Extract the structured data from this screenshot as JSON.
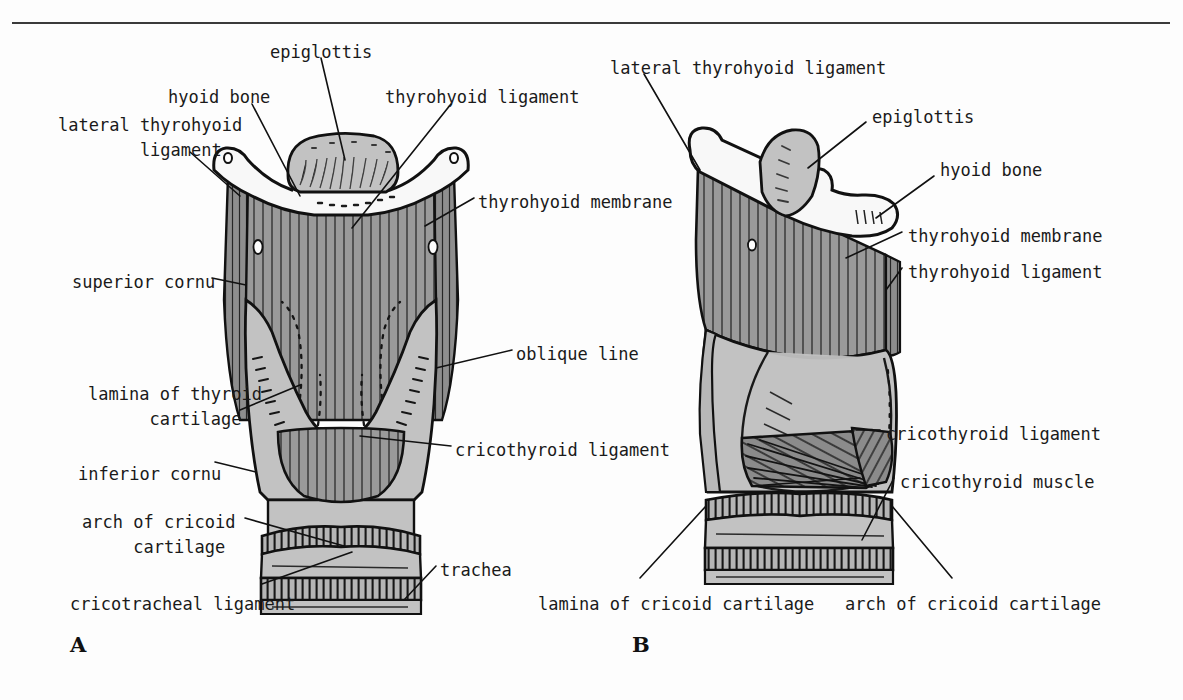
{
  "figure": {
    "panels": [
      {
        "letter": "A",
        "view": "anterior"
      },
      {
        "letter": "B",
        "view": "lateral"
      }
    ],
    "colors": {
      "ink": "#1a1a1a",
      "rule": "#3a3a3a",
      "background": "#fdfdfd",
      "cartilage_light": "#c2c2c2",
      "membrane_mid": "#9a9a9a",
      "membrane_dark": "#7d7d7d",
      "bone_white": "#f7f7f7",
      "outline": "#111111"
    }
  },
  "panel_a": {
    "letter": "A",
    "labels": [
      {
        "id": "epiglottis",
        "text": "epiglottis",
        "x": 270,
        "y": 40,
        "align": "left"
      },
      {
        "id": "hyoid-bone",
        "text": "hyoid bone",
        "x": 168,
        "y": 85,
        "align": "left"
      },
      {
        "id": "thyrohyoid-ligament",
        "text": "thyrohyoid ligament",
        "x": 385,
        "y": 85,
        "align": "left"
      },
      {
        "id": "lateral-thyrohyoid-ligament",
        "text": "lateral thyrohyoid\n        ligament",
        "x": 58,
        "y": 113,
        "align": "left"
      },
      {
        "id": "thyrohyoid-membrane",
        "text": "thyrohyoid membrane",
        "x": 478,
        "y": 190,
        "align": "left"
      },
      {
        "id": "superior-cornu",
        "text": "superior cornu",
        "x": 72,
        "y": 270,
        "align": "left"
      },
      {
        "id": "oblique-line",
        "text": "oblique line",
        "x": 516,
        "y": 342,
        "align": "left"
      },
      {
        "id": "lamina-of-thyroid-cartilage",
        "text": "lamina of thyroid\n      cartilage",
        "x": 88,
        "y": 382,
        "align": "left"
      },
      {
        "id": "cricothyroid-ligament",
        "text": "cricothyroid ligament",
        "x": 455,
        "y": 438,
        "align": "left"
      },
      {
        "id": "inferior-cornu",
        "text": "inferior cornu",
        "x": 78,
        "y": 462,
        "align": "left"
      },
      {
        "id": "arch-of-cricoid-cartilage",
        "text": "arch of cricoid\n     cartilage",
        "x": 82,
        "y": 510,
        "align": "left"
      },
      {
        "id": "trachea",
        "text": "trachea",
        "x": 440,
        "y": 558,
        "align": "left"
      },
      {
        "id": "cricotracheal-ligament",
        "text": "cricotracheal ligament",
        "x": 70,
        "y": 592,
        "align": "left"
      }
    ],
    "letter_pos": {
      "x": 70,
      "y": 632
    }
  },
  "panel_b": {
    "letter": "B",
    "labels": [
      {
        "id": "lateral-thyrohyoid-ligament",
        "text": "lateral thyrohyoid ligament",
        "x": 610,
        "y": 56,
        "align": "left"
      },
      {
        "id": "epiglottis",
        "text": "epiglottis",
        "x": 872,
        "y": 105,
        "align": "left"
      },
      {
        "id": "hyoid-bone",
        "text": "hyoid bone",
        "x": 940,
        "y": 158,
        "align": "left"
      },
      {
        "id": "thyrohyoid-membrane",
        "text": "thyrohyoid membrane",
        "x": 908,
        "y": 224,
        "align": "left"
      },
      {
        "id": "thyrohyoid-ligament",
        "text": "thyrohyoid ligament",
        "x": 908,
        "y": 260,
        "align": "left"
      },
      {
        "id": "cricothyroid-ligament",
        "text": "cricothyroid ligament",
        "x": 886,
        "y": 422,
        "align": "left"
      },
      {
        "id": "cricothyroid-muscle",
        "text": "cricothyroid muscle",
        "x": 900,
        "y": 470,
        "align": "left"
      },
      {
        "id": "lamina-of-cricoid-cartilage",
        "text": "lamina of cricoid cartilage",
        "x": 538,
        "y": 592,
        "align": "left"
      },
      {
        "id": "arch-of-cricoid-cartilage",
        "text": "arch of cricoid cartilage",
        "x": 845,
        "y": 592,
        "align": "left"
      }
    ],
    "letter_pos": {
      "x": 632,
      "y": 632
    }
  }
}
